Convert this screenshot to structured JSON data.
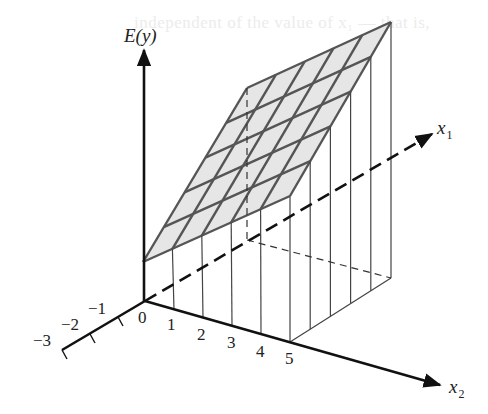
{
  "ghost_text": "independent of the value of x₁ — that is,",
  "axes": {
    "vertical_label": "E(y)",
    "x1_label": "x",
    "x1_sub": "1",
    "x2_label": "x",
    "x2_sub": "2",
    "x1_negative_ticks": [
      "−1",
      "−2",
      "−3"
    ],
    "x2_ticks": [
      "0",
      "1",
      "2",
      "3",
      "4",
      "5"
    ]
  },
  "plane": {
    "grid_rows": 5,
    "grid_cols": 5,
    "fill_color": "#e6e6e6",
    "edge_color": "#555555"
  },
  "colors": {
    "axis": "#111111",
    "drop_line": "#444444",
    "background": "#ffffff"
  }
}
